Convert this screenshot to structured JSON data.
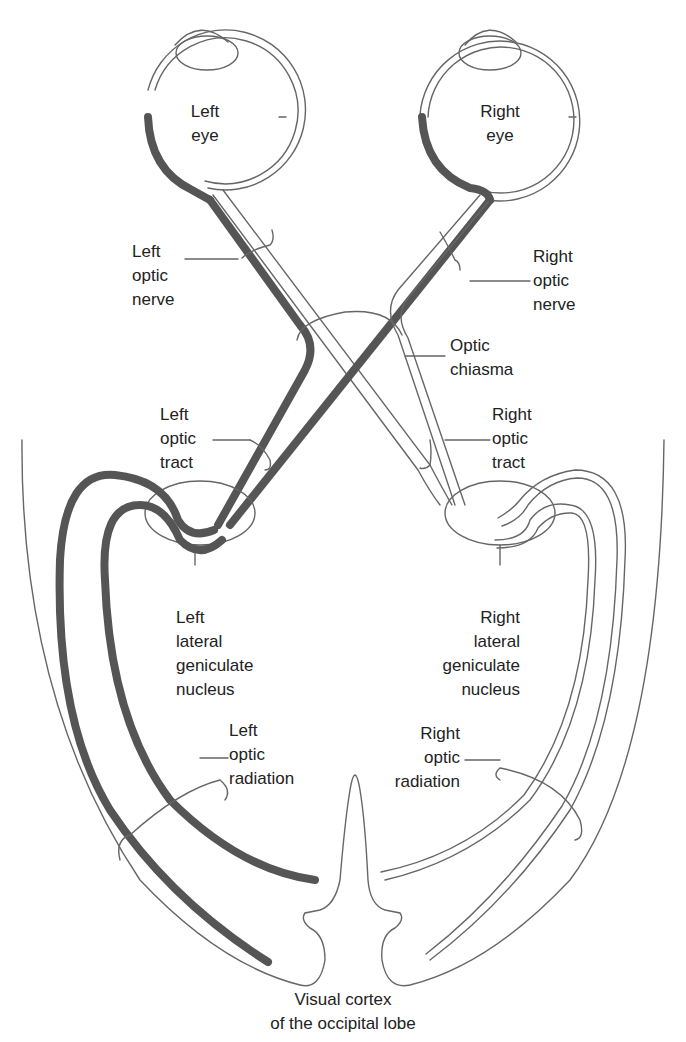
{
  "figure": {
    "title_cropped": "",
    "caption": [
      "Visual cortex",
      "of the occipital lobe"
    ]
  },
  "labels": {
    "left_eye": [
      "Left",
      "eye"
    ],
    "right_eye": [
      "Right",
      "eye"
    ],
    "left_optic_nerve": [
      "Left",
      "optic",
      "nerve"
    ],
    "right_optic_nerve": [
      "Right",
      "optic",
      "nerve"
    ],
    "optic_chiasma": [
      "Optic",
      "chiasma"
    ],
    "left_optic_tract": [
      "Left",
      "optic",
      "tract"
    ],
    "right_optic_tract": [
      "Right",
      "optic",
      "tract"
    ],
    "left_lgn": [
      "Left",
      "lateral",
      "geniculate",
      "nucleus"
    ],
    "right_lgn": [
      "Right",
      "lateral",
      "geniculate",
      "nucleus"
    ],
    "left_optic_radiation": [
      "Left",
      "optic",
      "radiation"
    ],
    "right_optic_radiation": [
      "Right",
      "optic",
      "radiation"
    ]
  },
  "colors": {
    "dark_pathway": "#555555",
    "outline": "#666666",
    "text": "#222222",
    "background": "#ffffff"
  }
}
